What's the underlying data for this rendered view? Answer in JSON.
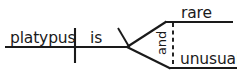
{
  "diagram": {
    "type": "reed-kellogg-sentence-diagram",
    "sentence": "platypus is rare and unusual",
    "ink_color": "#1a1a1a",
    "background_color": "#ffffff",
    "subject": {
      "label": "platypus",
      "role": "subject",
      "x": 10,
      "y": 43
    },
    "verb": {
      "label": "is",
      "role": "linking-verb",
      "x": 90,
      "y": 43
    },
    "complement_top": {
      "label": "rare",
      "role": "predicate-adjective",
      "x": 181,
      "y": 18
    },
    "complement_bottom": {
      "label": "unusual",
      "role": "predicate-adjective",
      "x": 180,
      "y": 64
    },
    "conjunction": {
      "label": "and",
      "role": "coordinating-conjunction",
      "rotation_deg": -90,
      "x": 166,
      "y": 48
    },
    "lines": {
      "baseline": {
        "x1": 5,
        "y1": 47,
        "x2": 129,
        "y2": 47
      },
      "subject_verb_divider": {
        "x1": 75,
        "y1": 28,
        "x2": 75,
        "y2": 63
      },
      "complement_slant": {
        "x1": 118,
        "y1": 28,
        "x2": 129,
        "y2": 47
      },
      "branch_upper": {
        "x1": 128,
        "y1": 47,
        "x2": 166,
        "y2": 22
      },
      "branch_lower": {
        "x1": 128,
        "y1": 47,
        "x2": 170,
        "y2": 68
      },
      "complement_line_top": {
        "x1": 165,
        "y1": 22,
        "x2": 232,
        "y2": 22
      },
      "complement_line_bottom": {
        "x1": 169,
        "y1": 68,
        "x2": 237,
        "y2": 68
      },
      "conjunction_dashed": {
        "x1": 173,
        "y1": 23,
        "x2": 173,
        "y2": 66
      }
    }
  }
}
